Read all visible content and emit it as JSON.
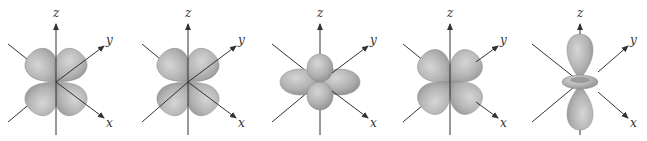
{
  "figure": {
    "lobe_color": "#a9a9a9",
    "lobe_highlight": "#d8d8d8",
    "axis_color": "#333333",
    "panels": [
      {
        "id": "dxz",
        "axes": {
          "z": "z",
          "y": "y",
          "x": "x"
        }
      },
      {
        "id": "dyz",
        "axes": {
          "z": "z",
          "y": "y",
          "x": "x"
        }
      },
      {
        "id": "dxy",
        "axes": {
          "z": "z",
          "y": "y",
          "x": "x"
        }
      },
      {
        "id": "dx2-y2",
        "axes": {
          "z": "z",
          "y": "y",
          "x": "x"
        }
      },
      {
        "id": "dz2",
        "axes": {
          "z": "z",
          "y": "y",
          "x": "x"
        }
      }
    ]
  }
}
